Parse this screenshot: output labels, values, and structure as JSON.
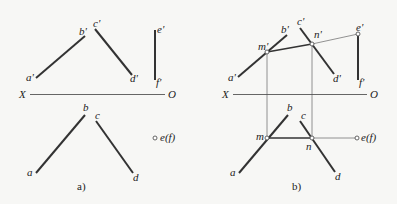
{
  "panels": [
    {
      "caption": "a)",
      "axis": {
        "left": "X",
        "right": "O"
      },
      "front_labels": {
        "a": "a'",
        "b": "b'",
        "c": "c'",
        "d": "d'",
        "e": "e'",
        "f": "f'"
      },
      "top_labels": {
        "a": "a",
        "b": "b",
        "c": "c",
        "d": "d",
        "ef": "e(f)"
      }
    },
    {
      "caption": "b)",
      "axis": {
        "left": "X",
        "right": "O"
      },
      "front_labels": {
        "a": "a'",
        "b": "b'",
        "c": "c'",
        "d": "d'",
        "e": "e'",
        "f": "f'",
        "m": "m'",
        "n": "n'"
      },
      "top_labels": {
        "a": "a",
        "b": "b",
        "c": "c",
        "d": "d",
        "ef": "e(f)",
        "m": "m",
        "n": "n"
      }
    }
  ],
  "colors": {
    "line": "#333333",
    "construction": "#777777",
    "background": "#f7f7f5"
  }
}
